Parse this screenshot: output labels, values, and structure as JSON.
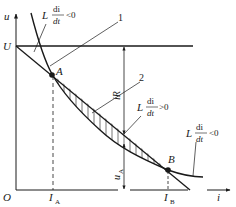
{
  "diagram": {
    "axes": {
      "y_label": "u",
      "x_label": "i",
      "origin_label": "O"
    },
    "levels": {
      "voltage_label": "U"
    },
    "points": [
      {
        "name": "A",
        "label": "A",
        "x_label": "I",
        "x_sub": "A"
      },
      {
        "name": "B",
        "label": "B",
        "x_label": "I",
        "x_sub": "B"
      }
    ],
    "curves": [
      {
        "id": "1",
        "label": "1",
        "description": "falling characteristic curve"
      },
      {
        "id": "2",
        "label": "2",
        "description": "load line U - iR"
      }
    ],
    "annotations": {
      "iR": "iR",
      "uA": "u",
      "uA_sub": "A",
      "top_condition": {
        "L": "L",
        "num": "di",
        "den": "dt",
        "rel": "<0"
      },
      "mid_condition": {
        "L": "L",
        "num": "di",
        "den": "dt",
        "rel": ">0"
      },
      "right_condition": {
        "L": "L",
        "num": "di",
        "den": "dt",
        "rel": "<0"
      }
    },
    "colors": {
      "line": "#1a1a1a",
      "background": "#ffffff"
    }
  }
}
